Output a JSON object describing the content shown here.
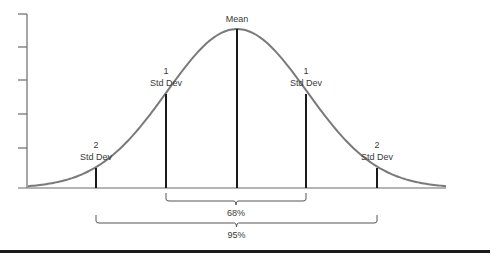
{
  "diagram": {
    "colors": {
      "curve": "#7a7a7a",
      "axis": "#6a6a6a",
      "lines": "#1a1a1a",
      "text": "#3a3a3a"
    },
    "markers": [
      {
        "id": "minus2",
        "line1": "2",
        "line2": "Std Dev",
        "x": 96,
        "top": 168
      },
      {
        "id": "minus1",
        "line1": "1",
        "line2": "Std Dev",
        "x": 166,
        "top": 94
      },
      {
        "id": "mean",
        "line1": "Mean",
        "line2": "",
        "x": 237,
        "top": 29
      },
      {
        "id": "plus1",
        "line1": "1",
        "line2": "Std Dev",
        "x": 306,
        "top": 94
      },
      {
        "id": "plus2",
        "line1": "2",
        "line2": "Std Dev",
        "x": 377,
        "top": 168
      }
    ],
    "braces": [
      {
        "id": "one-sd",
        "label": "68%",
        "x1": 166,
        "x2": 306
      },
      {
        "id": "two-sd",
        "label": "95%",
        "x1": 96,
        "x2": 377
      }
    ],
    "y_axis_ticks": 5
  }
}
